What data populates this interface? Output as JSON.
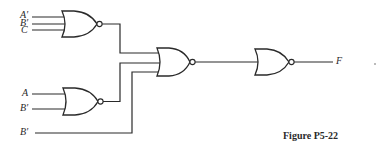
{
  "figure": {
    "caption": "Figure P5-22",
    "type": "logic-circuit",
    "gate_type": "NOR"
  },
  "gates": [
    {
      "id": "nor1",
      "type": "NOR",
      "inputs": [
        "A'",
        "B'",
        "C"
      ]
    },
    {
      "id": "nor2",
      "type": "NOR",
      "inputs": [
        "A",
        "B'"
      ]
    },
    {
      "id": "nor3",
      "type": "NOR",
      "inputs": [
        "nor1",
        "nor2",
        "B'"
      ]
    },
    {
      "id": "nor4",
      "type": "NOR",
      "inputs": [
        "nor3"
      ],
      "output": "F"
    }
  ],
  "labels": {
    "gate1_in1": "A′",
    "gate1_in2": "B′",
    "gate1_in3": "C",
    "gate2_in1": "A",
    "gate2_in2": "B′",
    "direct_in": "B′",
    "output": "F"
  },
  "colors": {
    "line": "#2a2a2a",
    "background": "#ffffff"
  }
}
